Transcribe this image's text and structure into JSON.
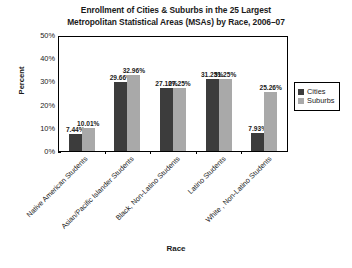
{
  "chart_data": {
    "type": "bar",
    "title": "Enrollment of Cities & Suburbs in the 25 Largest Metropolitan Statistical Areas (MSAs) by Race, 2006–07",
    "title_line1": "Enrollment of Cities & Suburbs in the 25 Largest",
    "title_line2": "Metropolitan Statistical Areas (MSAs) by Race, 2006–07",
    "xlabel": "Race",
    "ylabel": "Percent",
    "ylim": [
      0,
      50
    ],
    "yticks": [
      "0%",
      "10%",
      "20%",
      "30%",
      "40%",
      "50%"
    ],
    "ytick_values": [
      0,
      10,
      20,
      30,
      40,
      50
    ],
    "grid": false,
    "legend_position": "right",
    "categories": [
      "Native American Students",
      "Asian/Pacific Islander Students",
      "Black, Non-Latino Students",
      "Latino Students",
      "White , Non-Latino Students"
    ],
    "series": [
      {
        "name": "Cities",
        "color": "#3c3c3c",
        "values": [
          7.44,
          29.66,
          27.1,
          31.25,
          7.93
        ],
        "labels": [
          "7.44%",
          "29.66%",
          "27.10%",
          "31.25%",
          "7.93%"
        ]
      },
      {
        "name": "Suburbs",
        "color": "#a9a9a9",
        "values": [
          10.01,
          32.96,
          27.25,
          31.25,
          25.26
        ],
        "labels": [
          "10.01%",
          "32.96%",
          "27.25%",
          "31.25%",
          "25.26%"
        ]
      }
    ]
  }
}
